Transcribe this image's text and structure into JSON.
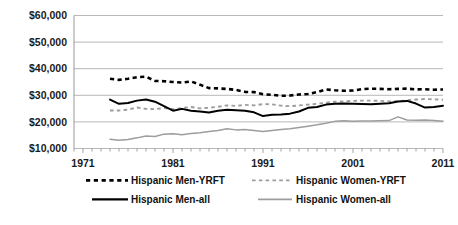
{
  "chart_data": {
    "type": "line",
    "title": "",
    "xlabel": "",
    "ylabel": "",
    "grid": true,
    "legend_position": "bottom",
    "xlim": [
      1970,
      2011
    ],
    "ylim": [
      10000,
      60000
    ],
    "ytick_labels": [
      "$60,000",
      "$50,000",
      "$40,000",
      "$30,000",
      "$20,000",
      "$10,000"
    ],
    "ytick_values": [
      60000,
      50000,
      40000,
      30000,
      20000,
      10000
    ],
    "xtick_labels": [
      "1971",
      "1981",
      "1991",
      "2001",
      "2011"
    ],
    "xtick_values": [
      1971,
      1981,
      1991,
      2001,
      2011
    ],
    "x": [
      1974,
      1975,
      1976,
      1977,
      1978,
      1979,
      1980,
      1981,
      1982,
      1983,
      1984,
      1985,
      1986,
      1987,
      1988,
      1989,
      1990,
      1991,
      1992,
      1993,
      1994,
      1995,
      1996,
      1997,
      1998,
      1999,
      2000,
      2001,
      2002,
      2003,
      2004,
      2005,
      2006,
      2007,
      2008,
      2009,
      2010,
      2011
    ],
    "series": [
      {
        "name": "Hispanic Men-YRFT",
        "color": "#000000",
        "style": "dashed",
        "values": [
          36200,
          35800,
          36200,
          36800,
          37000,
          35400,
          35300,
          35000,
          34800,
          35200,
          34000,
          32700,
          32600,
          32400,
          32000,
          31300,
          31200,
          30400,
          30200,
          29800,
          29900,
          30300,
          30500,
          31200,
          32200,
          31900,
          31700,
          31800,
          32300,
          32500,
          32400,
          32300,
          32400,
          32500,
          32200,
          32300,
          32100,
          32200
        ]
      },
      {
        "name": "Hispanic Women-YRFT",
        "color": "#9d9d9d",
        "style": "dashed",
        "values": [
          24300,
          24300,
          24600,
          25400,
          24900,
          24800,
          25200,
          24800,
          25200,
          25600,
          25100,
          25300,
          25700,
          26200,
          26000,
          26400,
          26200,
          26700,
          26600,
          26100,
          25900,
          26200,
          26500,
          26800,
          27200,
          27600,
          27700,
          27900,
          28000,
          28000,
          27900,
          27700,
          27800,
          28100,
          28400,
          28600,
          28500,
          28300
        ]
      },
      {
        "name": "Hispanic Men-all",
        "color": "#000000",
        "style": "solid",
        "values": [
          28400,
          26800,
          27100,
          28000,
          28400,
          27600,
          25900,
          24200,
          24900,
          24200,
          23900,
          23500,
          24200,
          24600,
          24400,
          24200,
          23600,
          22200,
          22700,
          22800,
          23100,
          23900,
          25300,
          25600,
          26500,
          26800,
          26900,
          26800,
          26700,
          26600,
          26800,
          27000,
          27700,
          27900,
          26900,
          25400,
          25600,
          26100
        ]
      },
      {
        "name": "Hispanic Women-all",
        "color": "#9d9d9d",
        "style": "solid",
        "values": [
          13500,
          13100,
          13400,
          14000,
          14700,
          14500,
          15400,
          15500,
          15200,
          15600,
          15900,
          16400,
          16800,
          17400,
          17000,
          17100,
          16800,
          16400,
          16800,
          17100,
          17400,
          17900,
          18400,
          18900,
          19500,
          20200,
          20400,
          20200,
          20300,
          20300,
          20400,
          20500,
          21900,
          20700,
          20600,
          20700,
          20500,
          20200
        ]
      }
    ]
  },
  "legend": {
    "items": [
      {
        "label": "Hispanic Men-YRFT",
        "swatch": "dashed-black-line-icon"
      },
      {
        "label": "Hispanic Women-YRFT",
        "swatch": "dashed-gray-line-icon"
      },
      {
        "label": "Hispanic Men-all",
        "swatch": "solid-black-line-icon"
      },
      {
        "label": "Hispanic Women-all",
        "swatch": "solid-gray-line-icon"
      }
    ]
  }
}
